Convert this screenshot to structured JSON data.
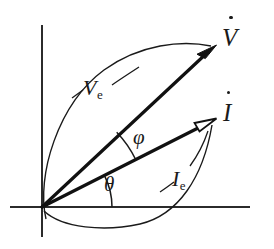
{
  "figure": {
    "name": "phasor-diagram",
    "type": "vector-phasor-diagram",
    "background_color": "#ffffff",
    "stroke_color": "#1a1a1a",
    "width": 274,
    "height": 249
  },
  "axes": {
    "origin": {
      "x": 42,
      "y": 207
    },
    "x_axis": {
      "from_x": 10,
      "to_x": 250,
      "y": 207
    },
    "y_axis": {
      "x": 42,
      "from_y": 25,
      "to_y": 237
    }
  },
  "vectors": [
    {
      "id": "v-vector",
      "label": "V",
      "accent": "dot",
      "arrowhead": "solid",
      "tip": {
        "x": 215,
        "y": 47
      },
      "angle_deg": 44.6
    },
    {
      "id": "i-vector",
      "label": "I",
      "accent": "dot",
      "arrowhead": "hollow",
      "tip": {
        "x": 215,
        "y": 120
      },
      "angle_deg": 26.7
    }
  ],
  "angles": [
    {
      "id": "phi-angle",
      "symbol": "φ",
      "between": [
        "i-vector",
        "v-vector"
      ],
      "arc_radius": 105
    },
    {
      "id": "theta-angle",
      "symbol": "θ",
      "between": [
        "x-axis",
        "i-vector"
      ],
      "arc_radius": 70
    }
  ],
  "sweep_labels": [
    {
      "id": "ve-sweep",
      "base": "V",
      "subscript": "e",
      "target": "v-vector",
      "description": "effective (RMS) voltage sweep arc"
    },
    {
      "id": "ie-sweep",
      "base": "I",
      "subscript": "e",
      "target": "i-vector",
      "description": "effective (RMS) current sweep arc"
    }
  ]
}
